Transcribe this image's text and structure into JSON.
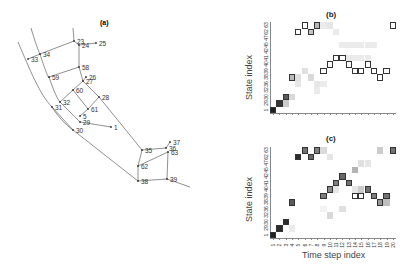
{
  "figure": {
    "panel_a": {
      "label": "(a)",
      "nodes": [
        {
          "id": "23",
          "x": 74,
          "y": 41
        },
        {
          "id": "24",
          "x": 79,
          "y": 45
        },
        {
          "id": "25",
          "x": 96,
          "y": 43
        },
        {
          "id": "34",
          "x": 40,
          "y": 54
        },
        {
          "id": "33",
          "x": 28,
          "y": 59
        },
        {
          "id": "58",
          "x": 79,
          "y": 67
        },
        {
          "id": "59",
          "x": 49,
          "y": 77
        },
        {
          "id": "26",
          "x": 86,
          "y": 77
        },
        {
          "id": "27",
          "x": 83,
          "y": 81
        },
        {
          "id": "60",
          "x": 73,
          "y": 90
        },
        {
          "id": "28",
          "x": 99,
          "y": 97
        },
        {
          "id": "32",
          "x": 60,
          "y": 102
        },
        {
          "id": "31",
          "x": 52,
          "y": 107
        },
        {
          "id": "61",
          "x": 88,
          "y": 109
        },
        {
          "id": "5",
          "x": 80,
          "y": 116
        },
        {
          "id": "29",
          "x": 80,
          "y": 122
        },
        {
          "id": "1",
          "x": 111,
          "y": 127
        },
        {
          "id": "30",
          "x": 73,
          "y": 130
        },
        {
          "id": "35",
          "x": 142,
          "y": 150
        },
        {
          "id": "37",
          "x": 170,
          "y": 142
        },
        {
          "id": "36",
          "x": 166,
          "y": 148
        },
        {
          "id": "63",
          "x": 168,
          "y": 152
        },
        {
          "id": "62",
          "x": 138,
          "y": 166
        },
        {
          "id": "38",
          "x": 138,
          "y": 181
        },
        {
          "id": "39",
          "x": 167,
          "y": 179
        }
      ]
    },
    "panel_b": {
      "label": "(b)"
    },
    "panel_c": {
      "label": "(c)"
    }
  },
  "chart_data": [
    {
      "type": "heatmap",
      "title": "(b)",
      "xlabel": "",
      "ylabel": "State index",
      "y_categories": [
        "1",
        "29",
        "30",
        "32",
        "36",
        "38",
        "39",
        "40",
        "41",
        "42",
        "45",
        "47",
        "62",
        "63"
      ],
      "x_categories": [
        "1",
        "2",
        "3",
        "4",
        "5",
        "6",
        "7",
        "8",
        "9",
        "10",
        "11",
        "12",
        "13",
        "14",
        "15",
        "16",
        "17",
        "18",
        "19",
        "20"
      ],
      "path_cells": [
        [
          0,
          0
        ],
        [
          1,
          1
        ],
        [
          2,
          2
        ],
        [
          3,
          5
        ],
        [
          4,
          12
        ],
        [
          5,
          13
        ],
        [
          6,
          12
        ],
        [
          7,
          13
        ],
        [
          8,
          6
        ],
        [
          9,
          7
        ],
        [
          10,
          8
        ],
        [
          11,
          8
        ],
        [
          12,
          7
        ],
        [
          13,
          6
        ],
        [
          14,
          6
        ],
        [
          15,
          7
        ],
        [
          16,
          6
        ],
        [
          17,
          5
        ],
        [
          18,
          6
        ],
        [
          19,
          13
        ]
      ],
      "path_fill": [
        0.95,
        0.85,
        0.7,
        0.3,
        0,
        0,
        0.25,
        0.3,
        0,
        0,
        0,
        0,
        0,
        0,
        0,
        0,
        0,
        0,
        0,
        0
      ],
      "background_cells": [
        [
          2,
          1,
          0.2
        ],
        [
          3,
          2,
          0.15
        ],
        [
          4,
          4,
          0.1
        ],
        [
          5,
          6,
          0.12
        ],
        [
          4,
          5,
          0.12
        ],
        [
          6,
          5,
          0.15
        ],
        [
          7,
          4,
          0.1
        ],
        [
          8,
          13,
          0.08
        ],
        [
          9,
          13,
          0.1
        ],
        [
          10,
          12,
          0.08
        ],
        [
          11,
          10,
          0.08
        ],
        [
          12,
          10,
          0.08
        ],
        [
          13,
          10,
          0.08
        ],
        [
          14,
          10,
          0.08
        ],
        [
          15,
          10,
          0.08
        ],
        [
          16,
          10,
          0.08
        ],
        [
          12,
          8,
          0.08
        ],
        [
          13,
          8,
          0.08
        ],
        [
          14,
          8,
          0.08
        ],
        [
          15,
          8,
          0.08
        ],
        [
          7,
          3,
          0.08
        ],
        [
          8,
          4,
          0.08
        ]
      ]
    },
    {
      "type": "heatmap",
      "title": "(c)",
      "xlabel": "Time step index",
      "ylabel": "State index",
      "y_categories": [
        "1",
        "29",
        "30",
        "32",
        "36",
        "38",
        "39",
        "40",
        "41",
        "42",
        "45",
        "47",
        "62",
        "63"
      ],
      "x_categories": [
        "1",
        "2",
        "3",
        "4",
        "5",
        "6",
        "7",
        "8",
        "9",
        "10",
        "11",
        "12",
        "13",
        "14",
        "15",
        "16",
        "17",
        "18",
        "19",
        "20"
      ],
      "path_cells": [
        [
          0,
          0
        ],
        [
          1,
          1
        ],
        [
          2,
          2
        ],
        [
          3,
          5
        ],
        [
          4,
          12
        ],
        [
          5,
          13
        ],
        [
          6,
          12
        ],
        [
          7,
          13
        ],
        [
          8,
          6
        ],
        [
          9,
          7
        ],
        [
          10,
          8
        ],
        [
          11,
          9
        ],
        [
          12,
          8
        ],
        [
          13,
          6
        ],
        [
          14,
          6
        ],
        [
          15,
          7
        ],
        [
          16,
          6
        ],
        [
          17,
          5
        ],
        [
          18,
          6
        ],
        [
          19,
          13
        ]
      ],
      "path_fill": [
        0.95,
        0.9,
        0.9,
        0.7,
        0.9,
        0.6,
        0.65,
        0.55,
        0.55,
        0.5,
        0.55,
        0.65,
        0.6,
        0,
        0,
        0.6,
        0.55,
        0.45,
        0.6,
        0.6
      ],
      "background_cells": [
        [
          3,
          1,
          0.08
        ],
        [
          8,
          13,
          0.15
        ],
        [
          9,
          12,
          0.1
        ],
        [
          17,
          13,
          0.2
        ],
        [
          18,
          5,
          0.25
        ],
        [
          13,
          10,
          0.3
        ],
        [
          14,
          11,
          0.12
        ],
        [
          15,
          11,
          0.1
        ],
        [
          14,
          7,
          0.2
        ],
        [
          13,
          7,
          0.1
        ],
        [
          10,
          7,
          0.1
        ],
        [
          9,
          3,
          0.15
        ],
        [
          11,
          4,
          0.12
        ],
        [
          8,
          4,
          0.05
        ]
      ]
    }
  ]
}
